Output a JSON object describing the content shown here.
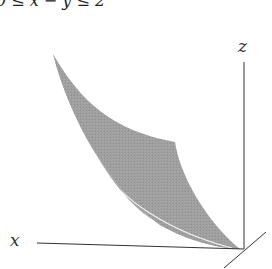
{
  "caption": "0 ≤ x − y ≤ 2",
  "axes": {
    "x_label": "x",
    "z_label": "z"
  },
  "colors": {
    "surface": "#9a9a9a",
    "surface_dark": "#6e6e6e",
    "axis": "#333333",
    "background": "#ffffff"
  }
}
